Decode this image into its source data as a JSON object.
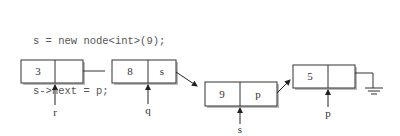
{
  "code": {
    "lines": [
      "s = new node<int>(9);",
      "s->next = p;",
      "q->next = s;"
    ]
  },
  "nodes": [
    {
      "value": "3",
      "next_label": "",
      "pointer": "r"
    },
    {
      "value": "8",
      "next_label": "s",
      "pointer": "q"
    },
    {
      "value": "9",
      "next_label": "p",
      "pointer": "s"
    },
    {
      "value": "5",
      "next_label": "",
      "pointer": "p"
    }
  ],
  "terminator": "ground-null-icon"
}
